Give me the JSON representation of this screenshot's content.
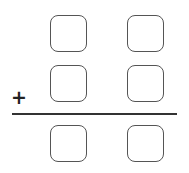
{
  "problem": {
    "operator": "+",
    "rows": [
      {
        "boxes": [
          "",
          ""
        ]
      },
      {
        "boxes": [
          "",
          ""
        ]
      }
    ],
    "result": {
      "boxes": [
        "",
        ""
      ]
    }
  }
}
